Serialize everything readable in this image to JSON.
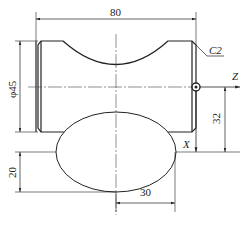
{
  "drawing": {
    "type": "engineering-part-drawing",
    "dimensions": {
      "overall_length": "80",
      "diameter": "φ45",
      "chamfer": "C2",
      "ellipse_offset": "32",
      "ellipse_semi_minor": "20",
      "ellipse_semi_major": "30"
    },
    "axes": {
      "z_label": "Z",
      "x_label": "X"
    },
    "colors": {
      "line": "#222222",
      "background": "#ffffff"
    }
  }
}
